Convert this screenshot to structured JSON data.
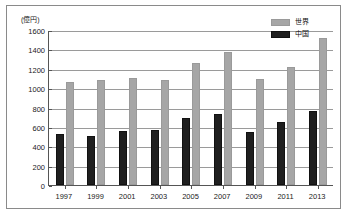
{
  "chart_data": {
    "type": "bar",
    "title": "",
    "subtitle": "",
    "unit_label": "(億円)",
    "xlabel": "",
    "ylabel": "",
    "ylim": [
      0,
      1600
    ],
    "ytick_step": 200,
    "yticks": [
      1600,
      1400,
      1200,
      1000,
      800,
      600,
      400,
      200,
      0
    ],
    "ytick_labels": [
      "1600",
      "1400",
      "1200",
      "1000",
      "800",
      "600",
      "400",
      "200",
      "0"
    ],
    "categories": [
      "1997",
      "1999",
      "2001",
      "2003",
      "2005",
      "2007",
      "2009",
      "2011",
      "2013"
    ],
    "grid": true,
    "grid_axis": "y",
    "legend_position": "top-right",
    "series": [
      {
        "name": "世界",
        "color": "#a6a6a6",
        "values": [
          1060,
          1080,
          1105,
          1080,
          1260,
          1375,
          1090,
          1220,
          1520
        ]
      },
      {
        "name": "中国",
        "color": "#1f1f1f",
        "values": [
          525,
          505,
          555,
          570,
          695,
          730,
          545,
          655,
          765
        ]
      }
    ]
  },
  "legend": {
    "items": [
      {
        "label": "世界",
        "swatch": "world"
      },
      {
        "label": "中国",
        "swatch": "china"
      }
    ]
  }
}
